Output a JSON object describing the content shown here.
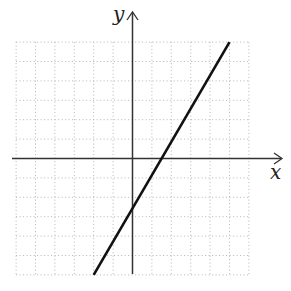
{
  "chart_data": {
    "type": "line",
    "title": "",
    "xlabel": "x",
    "ylabel": "y",
    "xlim": [
      -6,
      6
    ],
    "ylim": [
      -6,
      6
    ],
    "grid": true,
    "grid_style": "dotted",
    "tick_labels": false,
    "series": [
      {
        "name": "line",
        "equation": "y = 2x - 2",
        "x": [
          -2,
          5
        ],
        "y": [
          -6,
          6
        ]
      }
    ],
    "points": {
      "x_intercept": [
        1,
        0
      ],
      "y_intercept": [
        0,
        -2
      ]
    }
  },
  "axes": {
    "x_label": "x",
    "y_label": "y"
  },
  "colors": {
    "line": "#111111",
    "axis": "#333333",
    "grid": "#b0b0b0"
  }
}
